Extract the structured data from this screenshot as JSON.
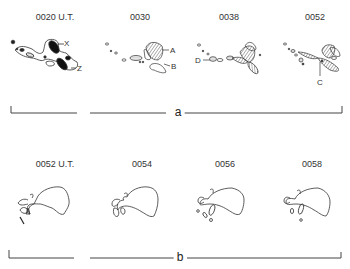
{
  "figure": {
    "row_a": {
      "bracket_label": "a",
      "frames": [
        {
          "time": "0020 U.T.",
          "annotations": [
            "X",
            "Z"
          ]
        },
        {
          "time": "0030",
          "annotations": [
            "A",
            "B"
          ]
        },
        {
          "time": "0038",
          "annotations": [
            "D"
          ]
        },
        {
          "time": "0052",
          "annotations": [
            "C"
          ]
        }
      ]
    },
    "row_b": {
      "bracket_label": "b",
      "frames": [
        {
          "time": "0052 U.T."
        },
        {
          "time": "0054"
        },
        {
          "time": "0056"
        },
        {
          "time": "0058"
        }
      ]
    }
  }
}
